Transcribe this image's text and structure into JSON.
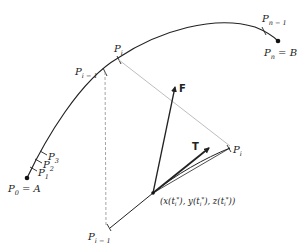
{
  "diagram": {
    "type": "parametric curve with tangent and force vectors",
    "colors": {
      "curve": "#222222",
      "dashed": "#9a9a9a",
      "vector": "#222222",
      "background": "#ffffff"
    },
    "labels": {
      "p0": {
        "base": "P",
        "sub": "0",
        "suffix": " = A"
      },
      "p1": {
        "base": "P",
        "sub": "1"
      },
      "p2": {
        "base": "P",
        "sub": "2"
      },
      "p3": {
        "base": "P",
        "sub": "3"
      },
      "pim1_upper": {
        "base": "P",
        "sub": "i − 1"
      },
      "pi_upper": {
        "base": "P",
        "sub": "i"
      },
      "pnm1": {
        "base": "P",
        "sub": "n − 1"
      },
      "pn": {
        "base": "P",
        "sub": "n",
        "suffix": " = B"
      },
      "pi_lower": {
        "base": "P",
        "sub": "i"
      },
      "pim1_lower": {
        "base": "P",
        "sub": "i − 1"
      },
      "force": "F",
      "tangent": "T",
      "point": {
        "open": "(x(t",
        "sub1": "i",
        "star1": "*",
        "mid1": "), y(t",
        "sub2": "i",
        "star2": "*",
        "mid2": "), z(t",
        "sub3": "i",
        "star3": "*",
        "close": "))"
      }
    }
  }
}
